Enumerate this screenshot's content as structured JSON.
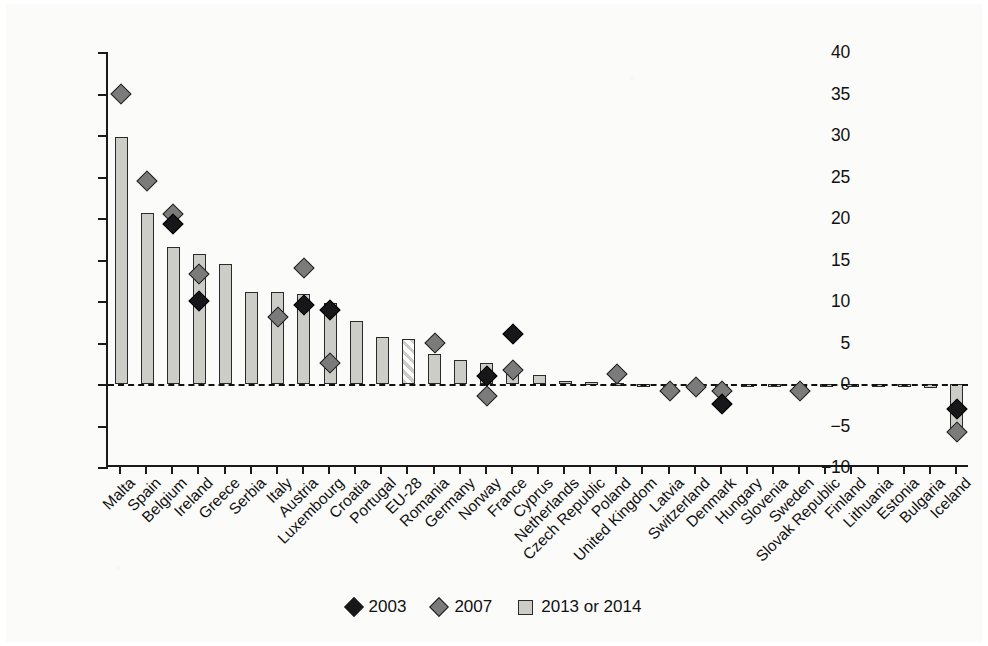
{
  "chart_data": {
    "type": "bar",
    "title": "",
    "xlabel": "",
    "ylabel": "Gender gap of people without any pension (%)",
    "ylim": [
      -10,
      40
    ],
    "ytick_step": 5,
    "yticks": [
      "40",
      "35",
      "30",
      "25",
      "20",
      "15",
      "10",
      "5",
      "0",
      "-5",
      "-10"
    ],
    "grid": false,
    "legend_position": "bottom-center",
    "zero_reference_line": true,
    "categories": [
      "Malta",
      "Spain",
      "Belgium",
      "Ireland",
      "Greece",
      "Serbia",
      "Italy",
      "Austria",
      "Luxembourg",
      "Croatia",
      "Portugal",
      "EU-28",
      "Romania",
      "Germany",
      "Norway",
      "France",
      "Cyprus",
      "Netherlands",
      "Czech Republic",
      "Poland",
      "United Kingdom",
      "Latvia",
      "Switzerland",
      "Denmark",
      "Hungary",
      "Slovenia",
      "Sweden",
      "Slovak Republic",
      "Finland",
      "Lithuania",
      "Estonia",
      "Bulgaria",
      "Iceland"
    ],
    "series": [
      {
        "name": "2013 or 2014",
        "type": "bar",
        "color": "#cdcdc8",
        "values": [
          29.7,
          20.6,
          16.5,
          15.7,
          14.4,
          11.1,
          11.1,
          10.8,
          9.8,
          7.6,
          5.7,
          5.4,
          3.6,
          2.9,
          2.5,
          1.7,
          1.1,
          0.4,
          0.2,
          0.1,
          0.0,
          0.0,
          0.0,
          0.0,
          -0.1,
          -0.2,
          -0.2,
          -0.3,
          -0.3,
          -0.4,
          -0.4,
          -0.5,
          -5.8
        ],
        "hatched_category": "EU-28"
      },
      {
        "name": "2007",
        "type": "scatter",
        "marker": "diamond",
        "color": "#7b7b7b",
        "points": [
          {
            "category": "Malta",
            "value": 35.0
          },
          {
            "category": "Spain",
            "value": 24.5
          },
          {
            "category": "Belgium",
            "value": 20.5
          },
          {
            "category": "Ireland",
            "value": 13.2
          },
          {
            "category": "Italy",
            "value": 8.1
          },
          {
            "category": "Austria",
            "value": 14.0
          },
          {
            "category": "Luxembourg",
            "value": 2.5
          },
          {
            "category": "Romania",
            "value": 5.0
          },
          {
            "category": "Norway",
            "value": -1.4
          },
          {
            "category": "France",
            "value": 1.7
          },
          {
            "category": "Poland",
            "value": 1.2
          },
          {
            "category": "Latvia",
            "value": -0.9
          },
          {
            "category": "Switzerland",
            "value": -0.4
          },
          {
            "category": "Denmark",
            "value": -0.8
          },
          {
            "category": "Sweden",
            "value": -0.9
          },
          {
            "category": "Iceland",
            "value": -5.8
          }
        ]
      },
      {
        "name": "2003",
        "type": "scatter",
        "marker": "diamond",
        "color": "#17171a",
        "points": [
          {
            "category": "Belgium",
            "value": 19.3
          },
          {
            "category": "Ireland",
            "value": 10.0
          },
          {
            "category": "Austria",
            "value": 9.5
          },
          {
            "category": "Luxembourg",
            "value": 8.9
          },
          {
            "category": "Norway",
            "value": 1.0
          },
          {
            "category": "France",
            "value": 6.0
          },
          {
            "category": "Denmark",
            "value": -2.4
          },
          {
            "category": "Iceland",
            "value": -3.0
          }
        ]
      }
    ],
    "legend": [
      {
        "label": "2003",
        "marker": "diamond",
        "color": "#17171a"
      },
      {
        "label": "2007",
        "marker": "diamond",
        "color": "#7b7b7b"
      },
      {
        "label": "2013 or 2014",
        "marker": "square",
        "color": "#cdcdc8"
      }
    ]
  }
}
